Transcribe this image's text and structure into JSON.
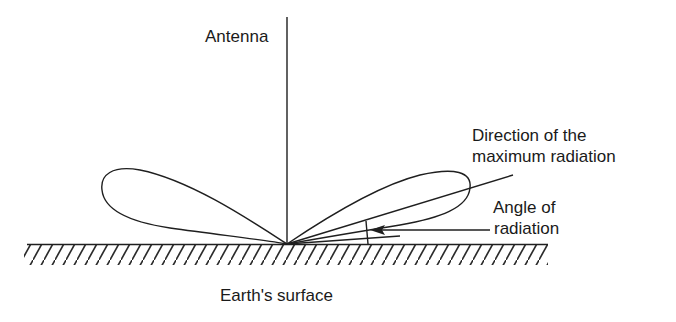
{
  "diagram": {
    "type": "antenna radiation pattern",
    "labels": {
      "antenna": "Antenna",
      "direction_line1": "Direction of the",
      "direction_line2": "maximum radiation",
      "angle_line1": "Angle of",
      "angle_line2": "radiation",
      "ground": "Earth's surface"
    },
    "colors": {
      "ink": "#1f1f1f",
      "background": "#ffffff"
    }
  }
}
